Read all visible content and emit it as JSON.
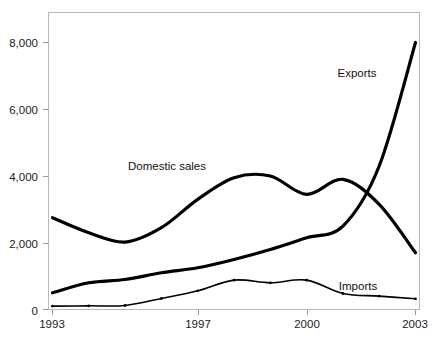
{
  "chart_data": {
    "type": "line",
    "title": "",
    "subtitle": "",
    "xlabel": "",
    "ylabel": "",
    "xlim": [
      1993,
      2003
    ],
    "ylim": [
      0,
      9000
    ],
    "grid": false,
    "legend_position": "inline-annotations",
    "x": [
      1993,
      1994,
      1995,
      1996,
      1997,
      1998,
      1999,
      2000,
      2001,
      2002,
      2003
    ],
    "xticks": [
      1993,
      1997,
      2000,
      2003
    ],
    "xtick_labels": [
      "1993",
      "1997",
      "2000",
      "2003"
    ],
    "yticks": [
      0,
      2000,
      4000,
      6000,
      8000
    ],
    "ytick_labels": [
      "0",
      "2,000",
      "4,000",
      "6,000",
      "8,000"
    ],
    "series": [
      {
        "name": "Domestic sales",
        "label": "Domestic sales",
        "color": "#000000",
        "line_width": 3.2,
        "values": [
          2750,
          2300,
          2020,
          2450,
          3300,
          3950,
          4000,
          3450,
          3900,
          3150,
          1700
        ]
      },
      {
        "name": "Exports",
        "label": "Exports",
        "color": "#000000",
        "line_width": 3.2,
        "values": [
          500,
          800,
          900,
          1100,
          1250,
          1500,
          1800,
          2150,
          2500,
          4300,
          8000
        ]
      },
      {
        "name": "Imports",
        "label": "Imports",
        "color": "#000000",
        "line_width": 1.6,
        "values": [
          100,
          110,
          120,
          330,
          560,
          880,
          800,
          880,
          480,
          400,
          320
        ]
      }
    ],
    "annotations": [
      {
        "text": "Exports",
        "x_px": 357,
        "y_px": 77
      },
      {
        "text": "Domestic sales",
        "x_px": 167,
        "y_px": 170
      },
      {
        "text": "Imports",
        "x_px": 358,
        "y_px": 290
      }
    ]
  },
  "axes": {
    "y_labels": [
      "8,000",
      "6,000",
      "4,000",
      "2,000",
      "0"
    ],
    "x_labels": [
      "1993",
      "1997",
      "2000",
      "2003"
    ]
  },
  "colors": {
    "line": "#000000",
    "frame": "#b9b9b9",
    "tick": "#9a9a9a",
    "text": "#1b1b1b",
    "background": "#ffffff"
  }
}
